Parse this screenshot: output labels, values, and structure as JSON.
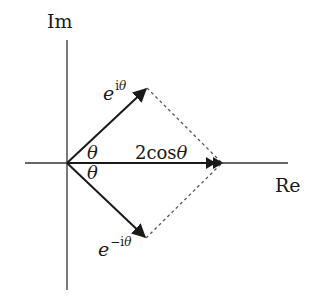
{
  "diagram": {
    "axes": {
      "imaginary_label": "Im",
      "real_label": "Re",
      "origin": [
        67,
        163
      ],
      "real_axis": {
        "x1": 25,
        "x2": 288,
        "y": 163
      },
      "imaginary_axis": {
        "x": 67,
        "y1": 40,
        "y2": 290
      }
    },
    "vectors": [
      {
        "name": "e-i-theta",
        "base": "e",
        "superscript_prefix": "",
        "superscript_i": "i",
        "superscript_theta": "θ",
        "from": [
          67,
          163
        ],
        "to": [
          147,
          88
        ]
      },
      {
        "name": "e-minus-i-theta",
        "base": "e",
        "superscript_prefix": "−",
        "superscript_i": "i",
        "superscript_theta": "θ",
        "from": [
          67,
          163
        ],
        "to": [
          146,
          238
        ]
      },
      {
        "name": "sum-2cos-theta",
        "label_prefix": "2cos",
        "label_theta": "θ",
        "from": [
          67,
          163
        ],
        "to": [
          222,
          163
        ],
        "double_arrowhead": true
      }
    ],
    "angles": [
      {
        "label": "θ",
        "position": "above-real-axis"
      },
      {
        "label": "θ",
        "position": "below-real-axis"
      }
    ],
    "dashed_lines": [
      {
        "from": [
          147,
          88
        ],
        "to": [
          222,
          163
        ]
      },
      {
        "from": [
          146,
          238
        ],
        "to": [
          222,
          163
        ]
      }
    ],
    "colors": {
      "line": "#1a1a1a",
      "axis": "#333333",
      "dashed": "#555555",
      "background": "#ffffff"
    }
  }
}
